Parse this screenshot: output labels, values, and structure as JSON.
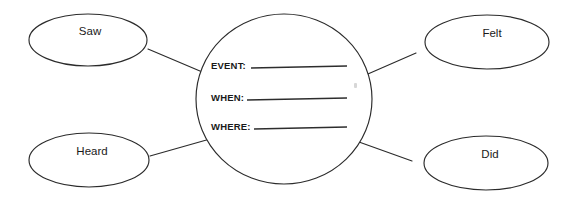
{
  "organizer": {
    "type": "web-graphic-organizer",
    "background_color": "#ffffff",
    "line_color": "#2b2b2b",
    "text_color": "#1a1a1a"
  },
  "center": {
    "name": "event-details-circle",
    "fields": [
      {
        "label": "EVENT:",
        "value": ""
      },
      {
        "label": "WHEN:",
        "value": ""
      },
      {
        "label": "WHERE:",
        "value": ""
      }
    ]
  },
  "nodes": [
    {
      "id": "saw",
      "label": "Saw",
      "position": "top-left"
    },
    {
      "id": "felt",
      "label": "Felt",
      "position": "top-right"
    },
    {
      "id": "heard",
      "label": "Heard",
      "position": "bottom-left"
    },
    {
      "id": "did",
      "label": "Did",
      "position": "bottom-right"
    }
  ]
}
